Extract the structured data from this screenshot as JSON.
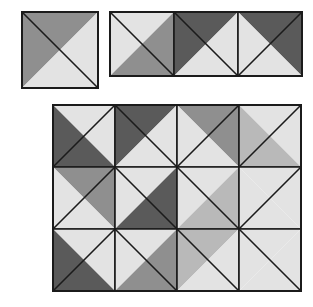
{
  "figure": {
    "background_color": "#ffffff",
    "line_color": "#1b1b1b",
    "palette": {
      "dark": "#5a5a5a",
      "medium": "#8f8f8f",
      "light_gray": "#b9b9b9",
      "light": "#e3e3e3"
    }
  },
  "panels": [
    {
      "name": "single-unit-panel",
      "label": "Single half-square triangle unit",
      "x": 21,
      "y": 11,
      "cell": 76,
      "cols": 1,
      "rows": 1,
      "cells": [
        {
          "row": 0,
          "col": 0,
          "diagonal": "main",
          "upper_color": "#8f8f8f",
          "lower_color": "#e3e3e3"
        }
      ]
    },
    {
      "name": "three-unit-strip-panel",
      "label": "Row of three units",
      "x": 109,
      "y": 11,
      "cell": 64,
      "cols": 3,
      "rows": 1,
      "cells": [
        {
          "row": 0,
          "col": 0,
          "diagonal": "main",
          "upper_color": "#e3e3e3",
          "lower_color": "#8f8f8f"
        },
        {
          "row": 0,
          "col": 1,
          "diagonal": "main",
          "upper_color": "#5a5a5a",
          "lower_color": "#e3e3e3"
        },
        {
          "row": 0,
          "col": 2,
          "diagonal": "anti",
          "upper_color": "#5a5a5a",
          "lower_color": "#e3e3e3"
        }
      ]
    },
    {
      "name": "quilt-block-panel",
      "label": "Four by three assembled quilt block",
      "x": 52,
      "y": 104,
      "cell": 62,
      "cols": 4,
      "rows": 3,
      "cells": [
        {
          "row": 0,
          "col": 0,
          "diagonal": "anti",
          "upper_color": "#e3e3e3",
          "lower_color": "#5a5a5a"
        },
        {
          "row": 0,
          "col": 1,
          "diagonal": "main",
          "upper_color": "#5a5a5a",
          "lower_color": "#e3e3e3"
        },
        {
          "row": 0,
          "col": 2,
          "diagonal": "anti",
          "upper_color": "#8f8f8f",
          "lower_color": "#e3e3e3"
        },
        {
          "row": 0,
          "col": 3,
          "diagonal": "anti",
          "upper_color": "#e3e3e3",
          "lower_color": "#b9b9b9"
        },
        {
          "row": 1,
          "col": 0,
          "diagonal": "anti",
          "upper_color": "#8f8f8f",
          "lower_color": "#e3e3e3"
        },
        {
          "row": 1,
          "col": 1,
          "diagonal": "main",
          "upper_color": "#e3e3e3",
          "lower_color": "#5a5a5a"
        },
        {
          "row": 1,
          "col": 2,
          "diagonal": "main",
          "upper_color": "#e3e3e3",
          "lower_color": "#b9b9b9"
        },
        {
          "row": 1,
          "col": 3,
          "diagonal": "anti",
          "upper_color": "#e3e3e3",
          "lower_color": "#e3e3e3"
        },
        {
          "row": 2,
          "col": 0,
          "diagonal": "anti",
          "upper_color": "#e3e3e3",
          "lower_color": "#5a5a5a"
        },
        {
          "row": 2,
          "col": 1,
          "diagonal": "main",
          "upper_color": "#e3e3e3",
          "lower_color": "#8f8f8f"
        },
        {
          "row": 2,
          "col": 2,
          "diagonal": "main",
          "upper_color": "#b9b9b9",
          "lower_color": "#e3e3e3"
        },
        {
          "row": 2,
          "col": 3,
          "diagonal": "main",
          "upper_color": "#e3e3e3",
          "lower_color": "#e3e3e3"
        }
      ]
    }
  ]
}
